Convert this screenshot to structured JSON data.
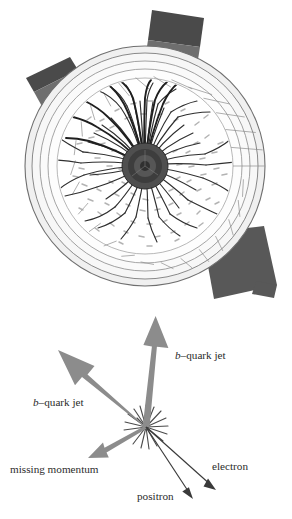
{
  "figure": {
    "kind": "particle-collision-event-display",
    "background_color": "#ffffff",
    "detector": {
      "name": "transverse-view-detector-cross-section",
      "center": {
        "x": 145,
        "y": 166
      },
      "outer_radius": 120,
      "ring_radii": [
        120,
        113,
        105,
        97,
        88
      ],
      "ring_stroke_color": "#7a7a7a",
      "ring_fill_color": "#f2f2f2",
      "inner_volume_fill": "#fdfdfd",
      "segment_count": 22,
      "beam_core": {
        "name": "beam-pipe-core",
        "radius": 23,
        "fill_color": "#5a5a5a"
      },
      "track_color": "#3a3a3a",
      "hit_color": "#8a8a8a",
      "outer_blocks": [
        {
          "name": "calorimeter-block-top",
          "fill_dark": "#4a4a4a",
          "fill_light": "#6e6e6e"
        },
        {
          "name": "calorimeter-block-upper-left",
          "fill_dark": "#4a4a4a",
          "fill_light": "#6e6e6e"
        },
        {
          "name": "calorimeter-block-lower-right",
          "fill_dark": "#585858",
          "fill_light": "#5e5e5e"
        }
      ]
    },
    "vertex": {
      "name": "interaction-vertex",
      "x": 146,
      "y": 427,
      "ray_count": 18,
      "ray_color": "#4a4a4a"
    },
    "arrows": [
      {
        "id": "bjet-vertical",
        "name": "b-quark-jet-arrow-vertical",
        "color": "#8c8c8c",
        "from": {
          "x": 146,
          "y": 427
        },
        "to": {
          "x": 156,
          "y": 316
        },
        "shaft_width": 7,
        "head_length": 40,
        "head_width": 26
      },
      {
        "id": "bjet-left",
        "name": "b-quark-jet-arrow-left",
        "color": "#8c8c8c",
        "from": {
          "x": 146,
          "y": 427
        },
        "to": {
          "x": 58,
          "y": 350
        },
        "shaft_width": 6,
        "head_length": 34,
        "head_width": 22
      },
      {
        "id": "missing-momentum",
        "name": "missing-momentum-arrow",
        "color": "#8c8c8c",
        "from": {
          "x": 146,
          "y": 427
        },
        "to": {
          "x": 88,
          "y": 458
        },
        "shaft_width": 3,
        "head_length": 17,
        "head_width": 11
      },
      {
        "id": "electron",
        "name": "electron-arrow",
        "color": "#3a3a3a",
        "from": {
          "x": 146,
          "y": 427
        },
        "to": {
          "x": 214,
          "y": 488
        },
        "shaft_width": 1.1,
        "head_length": 11,
        "head_width": 7
      },
      {
        "id": "positron",
        "name": "positron-arrow",
        "color": "#3a3a3a",
        "from": {
          "x": 146,
          "y": 427
        },
        "to": {
          "x": 192,
          "y": 497
        },
        "shaft_width": 1.1,
        "head_length": 11,
        "head_width": 7
      }
    ],
    "labels": [
      {
        "id": "bjet-right-label",
        "name": "label-b-quark-jet-right",
        "italic_prefix": "b",
        "text": "–quark jet",
        "full_text": "b–quark jet",
        "x": 175,
        "y": 359,
        "anchor": "start"
      },
      {
        "id": "bjet-left-label",
        "name": "label-b-quark-jet-left",
        "italic_prefix": "b",
        "text": "–quark jet",
        "full_text": "b–quark jet",
        "x": 33,
        "y": 406,
        "anchor": "start"
      },
      {
        "id": "missing-momentum-label",
        "name": "label-missing-momentum",
        "italic_prefix": "",
        "text": "missing momentum",
        "full_text": "missing momentum",
        "x": 10,
        "y": 473,
        "anchor": "start"
      },
      {
        "id": "electron-label",
        "name": "label-electron",
        "italic_prefix": "",
        "text": "electron",
        "full_text": "electron",
        "x": 212,
        "y": 470,
        "anchor": "start"
      },
      {
        "id": "positron-label",
        "name": "label-positron",
        "italic_prefix": "",
        "text": "positron",
        "full_text": "positron",
        "x": 137,
        "y": 500,
        "anchor": "start"
      }
    ]
  }
}
